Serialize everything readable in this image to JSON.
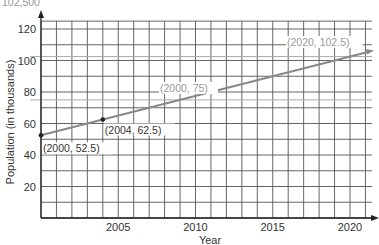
{
  "top_text": "102,500",
  "chart_data": {
    "type": "line",
    "title": "",
    "xlabel": "Year",
    "ylabel": "Population (in thousands)",
    "xlim": [
      2000,
      2021.5
    ],
    "ylim": [
      0,
      125
    ],
    "x_ticks": [
      2005,
      2010,
      2015,
      2020
    ],
    "y_ticks": [
      20,
      40,
      60,
      80,
      100,
      120
    ],
    "grid": true,
    "grid_x_step": 1,
    "grid_y_step": 10,
    "series": [
      {
        "name": "Population",
        "x": [
          2000,
          2004,
          2009,
          2020
        ],
        "values": [
          52.5,
          62.5,
          75,
          102.5
        ]
      }
    ],
    "annotations": [
      {
        "text": "(2000, 52.5)",
        "x": 2000,
        "y": 52.5,
        "style": "dark"
      },
      {
        "text": "(2004, 62.5)",
        "x": 2004,
        "y": 62.5,
        "style": "dark"
      },
      {
        "text": "(2000, 75)",
        "x": 2009,
        "y": 75,
        "style": "faded"
      },
      {
        "text": "(2020, 102.5)",
        "x": 2020,
        "y": 102.5,
        "style": "faded"
      }
    ],
    "reference_lines": [
      102.5,
      75
    ]
  }
}
